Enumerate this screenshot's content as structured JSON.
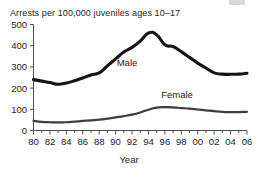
{
  "chart_data": {
    "type": "line",
    "title": "Arrests per 100,000 juveniles ages 10–17",
    "xlabel": "Year",
    "ylabel": "",
    "grid": false,
    "legend_position": "inline-annotation",
    "xlim": [
      1980,
      2006
    ],
    "ylim": [
      0,
      500
    ],
    "ytick_values": [
      0,
      100,
      200,
      300,
      400,
      500
    ],
    "ytick_labels": [
      "0",
      "100",
      "200",
      "300",
      "400",
      "500"
    ],
    "xtick_values": [
      1980,
      1982,
      1984,
      1986,
      1988,
      1990,
      1992,
      1994,
      1996,
      1998,
      2000,
      2002,
      2004,
      2006
    ],
    "xtick_labels": [
      "80",
      "82",
      "84",
      "86",
      "88",
      "90",
      "92",
      "94",
      "96",
      "98",
      "00",
      "02",
      "04",
      "06"
    ],
    "x": [
      1980,
      1981,
      1982,
      1983,
      1984,
      1985,
      1986,
      1987,
      1988,
      1989,
      1990,
      1991,
      1992,
      1993,
      1994,
      1995,
      1996,
      1997,
      1998,
      1999,
      2000,
      2001,
      2002,
      2003,
      2004,
      2005,
      2006
    ],
    "series": [
      {
        "name": "Male",
        "color": "#151515",
        "line_width": 3.1,
        "label_text": "Male",
        "values": [
          240,
          233,
          226,
          218,
          224,
          235,
          248,
          262,
          272,
          305,
          338,
          370,
          392,
          422,
          460,
          452,
          404,
          396,
          372,
          345,
          318,
          295,
          272,
          266,
          265,
          266,
          270
        ]
      },
      {
        "name": "Female",
        "color": "#3d3d3d",
        "line_width": 2.2,
        "label_text": "Female",
        "values": [
          45,
          41,
          39,
          38,
          39,
          42,
          45,
          48,
          51,
          56,
          62,
          68,
          75,
          85,
          98,
          108,
          110,
          109,
          106,
          103,
          99,
          95,
          91,
          88,
          87,
          87,
          88
        ]
      }
    ]
  }
}
